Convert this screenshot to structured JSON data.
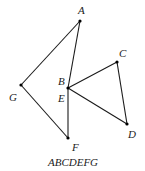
{
  "diagram": {
    "caption": "ABCDEFG",
    "points": [
      {
        "id": "A",
        "label": "A",
        "x": 80,
        "y": 21,
        "lx": 78,
        "ly": 14
      },
      {
        "id": "B",
        "label": "B",
        "x": 68,
        "y": 88,
        "lx": 58,
        "ly": 85
      },
      {
        "id": "C",
        "label": "C",
        "x": 117,
        "y": 62,
        "lx": 119,
        "ly": 57
      },
      {
        "id": "D",
        "label": "D",
        "x": 127,
        "y": 124,
        "lx": 128,
        "ly": 138
      },
      {
        "id": "E",
        "label": "E",
        "x": 68,
        "y": 88,
        "lx": 58,
        "ly": 102
      },
      {
        "id": "F",
        "label": "F",
        "x": 68,
        "y": 138,
        "lx": 72,
        "ly": 151
      },
      {
        "id": "G",
        "label": "G",
        "x": 21,
        "y": 85,
        "lx": 9,
        "ly": 101
      }
    ],
    "edges": [
      {
        "from": "A",
        "to": "B"
      },
      {
        "from": "B",
        "to": "C"
      },
      {
        "from": "C",
        "to": "D"
      },
      {
        "from": "D",
        "to": "E"
      },
      {
        "from": "E",
        "to": "F"
      },
      {
        "from": "F",
        "to": "G"
      },
      {
        "from": "G",
        "to": "A"
      }
    ]
  }
}
